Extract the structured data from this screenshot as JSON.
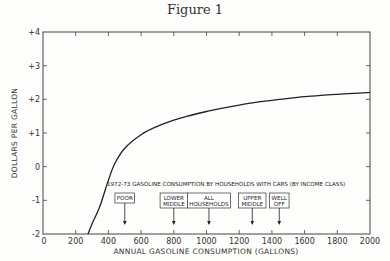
{
  "figure": {
    "title": "Figure 1"
  },
  "chart_data": {
    "type": "line",
    "title": "Figure 1",
    "xlabel": "ANNUAL GASOLINE CONSUMPTION (GALLONS)",
    "ylabel": "DOLLARS PER GALLON",
    "xlim": [
      0,
      2000
    ],
    "ylim": [
      -2,
      4
    ],
    "x_ticks": [
      0,
      200,
      400,
      600,
      800,
      1000,
      1200,
      1400,
      1600,
      1800,
      2000
    ],
    "x_tick_labels": [
      "0",
      "200",
      "400",
      "600",
      "800",
      "1000",
      "1200",
      "1400",
      "1600",
      "1800",
      "2000"
    ],
    "y_ticks": [
      -2,
      -1,
      0,
      1,
      2,
      3,
      4
    ],
    "y_tick_labels": [
      "-2",
      "-1",
      "0",
      "+1",
      "+2",
      "+3",
      "+4"
    ],
    "grid": false,
    "series": [
      {
        "name": "Curve",
        "x": [
          275,
          300,
          350,
          400,
          440,
          500,
          600,
          700,
          800,
          900,
          1000,
          1100,
          1200,
          1300,
          1400,
          1500,
          1600,
          1700,
          1800,
          1900,
          2000
        ],
        "y": [
          -2.0,
          -1.7,
          -1.15,
          -0.4,
          0.1,
          0.55,
          0.95,
          1.2,
          1.38,
          1.52,
          1.64,
          1.74,
          1.83,
          1.91,
          1.97,
          2.03,
          2.08,
          2.12,
          2.15,
          2.18,
          2.21
        ]
      }
    ],
    "annotation_title": "1972-73 GASOLINE CONSUMPTION BY HOUSEHOLDS WITH CARS (BY INCOME CLASS)",
    "annotations": [
      {
        "label_lines": [
          "POOR"
        ],
        "x": 500
      },
      {
        "label_lines": [
          "LOWER",
          "MIDDLE"
        ],
        "x": 800
      },
      {
        "label_lines": [
          "ALL",
          "HOUSEHOLDS"
        ],
        "x": 1015
      },
      {
        "label_lines": [
          "UPPER",
          "MIDDLE"
        ],
        "x": 1280
      },
      {
        "label_lines": [
          "WELL",
          "OFF"
        ],
        "x": 1445
      }
    ]
  }
}
